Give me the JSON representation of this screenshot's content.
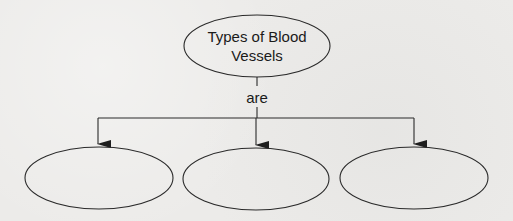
{
  "diagram": {
    "type": "concept-map",
    "root": {
      "id": "root",
      "label_line1": "Types of Blood",
      "label_line2": "Vessels",
      "shape": "ellipse",
      "cx": 257,
      "cy": 46,
      "rx": 73,
      "ry": 31
    },
    "connector": {
      "label": "are"
    },
    "children": [
      {
        "id": "child-1",
        "label": "",
        "shape": "ellipse",
        "cx": 99,
        "cy": 178,
        "rx": 74,
        "ry": 31
      },
      {
        "id": "child-2",
        "label": "",
        "shape": "ellipse",
        "cx": 256,
        "cy": 179,
        "rx": 73,
        "ry": 31
      },
      {
        "id": "child-3",
        "label": "",
        "shape": "ellipse",
        "cx": 414,
        "cy": 178,
        "rx": 74,
        "ry": 31
      }
    ],
    "colors": {
      "stroke": "#2a2a2a",
      "text": "#1a1a1a",
      "background": "#ecebe9"
    }
  }
}
